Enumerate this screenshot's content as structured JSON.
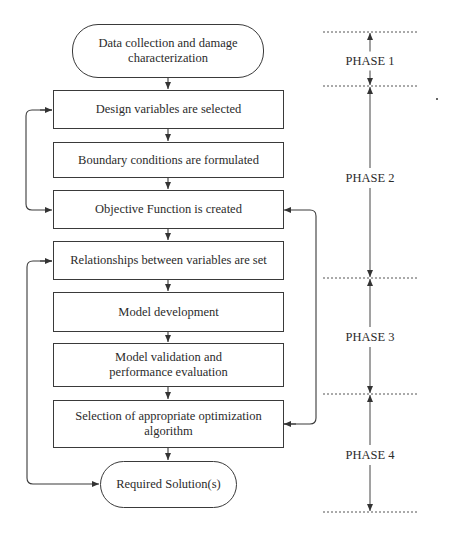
{
  "flowchart": {
    "nodes": [
      {
        "id": "start",
        "type": "terminal",
        "label": "Data collection and damage characterization"
      },
      {
        "id": "n1",
        "type": "process",
        "label": "Design variables are selected"
      },
      {
        "id": "n2",
        "type": "process",
        "label": "Boundary conditions are formulated"
      },
      {
        "id": "n3",
        "type": "process",
        "label": "Objective Function is created"
      },
      {
        "id": "n4",
        "type": "process",
        "label": "Relationships between variables are set"
      },
      {
        "id": "n5",
        "type": "process",
        "label": "Model development"
      },
      {
        "id": "n6",
        "type": "process",
        "label": "Model validation and performance evaluation"
      },
      {
        "id": "n7",
        "type": "process",
        "label": "Selection of appropriate optimization algorithm"
      },
      {
        "id": "end",
        "type": "terminal",
        "label": "Required Solution(s)"
      }
    ],
    "edges": [
      {
        "from": "start",
        "to": "n1"
      },
      {
        "from": "n1",
        "to": "n2"
      },
      {
        "from": "n2",
        "to": "n3"
      },
      {
        "from": "n3",
        "to": "n4"
      },
      {
        "from": "n4",
        "to": "n5"
      },
      {
        "from": "n5",
        "to": "n6"
      },
      {
        "from": "n6",
        "to": "n7"
      },
      {
        "from": "n7",
        "to": "end"
      },
      {
        "from": "n1",
        "to": "n3",
        "type": "feedback-loop-left"
      },
      {
        "from": "n4",
        "to": "end",
        "type": "feedback-loop-left"
      },
      {
        "from": "n7",
        "to": "n3",
        "type": "feedback-loop-right"
      }
    ]
  },
  "phases": [
    {
      "label": "PHASE 1"
    },
    {
      "label": "PHASE 2"
    },
    {
      "label": "PHASE 3"
    },
    {
      "label": "PHASE 4"
    }
  ],
  "colors": {
    "line": "#3a3a3a",
    "dash": "#555555",
    "background": "#ffffff"
  }
}
